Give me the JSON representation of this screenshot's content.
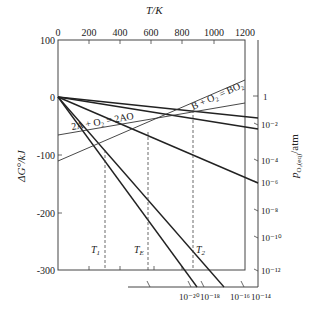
{
  "diagram": {
    "type": "ellingham",
    "top_axis": {
      "title": "T/K",
      "ticks": [
        "0",
        "200",
        "400",
        "600",
        "800",
        "1000",
        "1200"
      ],
      "range": [
        0,
        1200
      ]
    },
    "left_axis": {
      "title": "ΔG°/kJ",
      "ticks": [
        "100",
        "0",
        "-100",
        "-200",
        "-300"
      ],
      "range": [
        -300,
        100
      ]
    },
    "right_axis": {
      "title": "pO2(eq)/atm",
      "ticks": [
        "1",
        "10⁻²",
        "10⁻⁴",
        "10⁻⁶",
        "10⁻⁸",
        "10⁻¹⁰",
        "10⁻¹²"
      ]
    },
    "bottom_scale": {
      "ticks": [
        "10⁻²⁰",
        "10⁻¹⁸",
        "10⁻¹⁶",
        "10⁻¹⁴"
      ]
    },
    "reactions": [
      {
        "label": "2A + O₂ = 2AO",
        "dG_at_0K": -110,
        "dG_at_1200K": -20
      },
      {
        "label": "B + O₂ = BO₂",
        "dG_at_0K": -150,
        "dG_at_1200K": 25
      }
    ],
    "temperature_markers": [
      {
        "label": "T₁",
        "T": 300
      },
      {
        "label": "T_E",
        "T": 580
      },
      {
        "label": "T₂",
        "T": 870
      }
    ],
    "labels": {
      "T1": "T",
      "T1_sub": "1",
      "TE": "T",
      "TE_sub": "E",
      "T2": "T",
      "T2_sub": "2",
      "rxnA": "2A + O₂ = 2AO",
      "rxnB": "B + O₂ = BO₂",
      "top_title": "T/K",
      "left_title": "ΔG°/kJ",
      "right_title_main": "p",
      "right_title_sub": "O₂(eq)",
      "right_title_unit": "/atm"
    }
  }
}
